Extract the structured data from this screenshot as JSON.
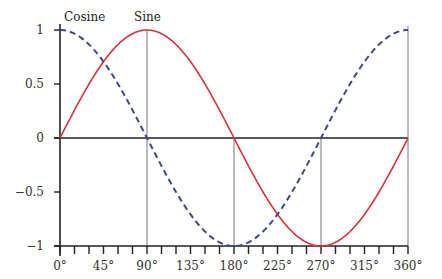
{
  "chart_data": {
    "type": "line",
    "title": "",
    "xlabel": "",
    "ylabel": "",
    "xlim": [
      0,
      360
    ],
    "ylim": [
      -1,
      1
    ],
    "x_ticks": [
      0,
      45,
      90,
      135,
      180,
      225,
      270,
      315,
      360
    ],
    "x_tick_labels": [
      "0°",
      "45°",
      "90°",
      "135°",
      "180°",
      "225°",
      "270°",
      "315°",
      "360°"
    ],
    "x_minor_tick_step": 15,
    "y_ticks": [
      1,
      0.5,
      0,
      -0.5,
      -1
    ],
    "y_tick_labels": [
      "1",
      "0.5",
      "0",
      "−0.5",
      "−1"
    ],
    "reference_lines_x": [
      90,
      180,
      270,
      360
    ],
    "grid": false,
    "legend": "inline labels",
    "series": [
      {
        "name": "Sine",
        "function": "sin",
        "color": "#d8323a",
        "style": "solid",
        "x": [
          0,
          45,
          90,
          135,
          180,
          225,
          270,
          315,
          360
        ],
        "values": [
          0,
          0.707,
          1,
          0.707,
          0,
          -0.707,
          -1,
          -0.707,
          0
        ]
      },
      {
        "name": "Cosine",
        "function": "cos",
        "color": "#3b4a8c",
        "style": "dashed",
        "x": [
          0,
          45,
          90,
          135,
          180,
          225,
          270,
          315,
          360
        ],
        "values": [
          1,
          0.707,
          0,
          -0.707,
          -1,
          -0.707,
          0,
          0.707,
          1
        ]
      }
    ],
    "annotations": [
      {
        "text": "Cosine",
        "near_x": 0,
        "near_y": 1
      },
      {
        "text": "Sine",
        "near_x": 90,
        "near_y": 1
      }
    ]
  }
}
